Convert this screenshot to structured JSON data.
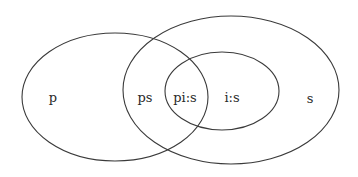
{
  "diagram": {
    "type": "venn",
    "sets": [
      {
        "id": "p",
        "label": "p",
        "description": "left ellipse"
      },
      {
        "id": "s",
        "label": "s",
        "description": "large right ellipse"
      },
      {
        "id": "i",
        "label": "i:s",
        "description": "inner ellipse contained in s"
      }
    ],
    "regions": {
      "p_only": "p",
      "p_and_s": "ps",
      "p_and_i": "pi:s",
      "i_only": "i:s",
      "s_only": "s"
    },
    "stroke_color": "#3a3a3a",
    "background": "#ffffff"
  }
}
